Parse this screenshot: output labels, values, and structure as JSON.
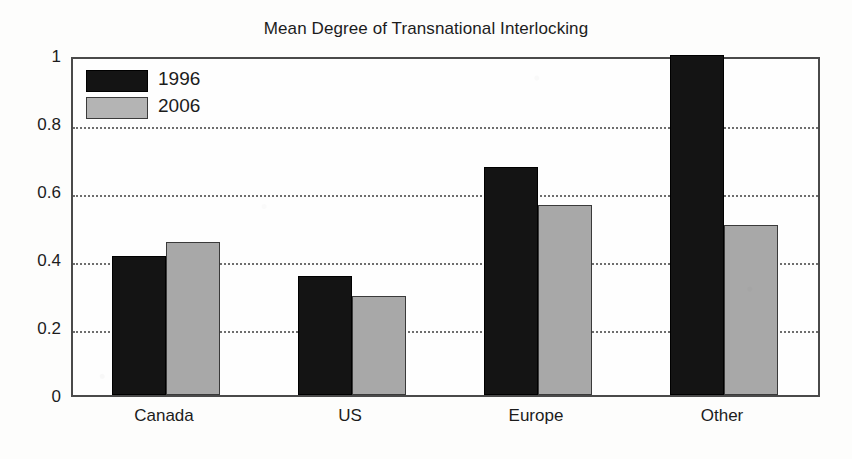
{
  "chart_data": {
    "type": "bar",
    "title": "Mean Degree of Transnational Interlocking",
    "xlabel": "",
    "ylabel": "",
    "categories": [
      "Canada",
      "US",
      "Europe",
      "Other"
    ],
    "series": [
      {
        "name": "1996",
        "color": "#141414",
        "values": [
          0.41,
          0.35,
          0.67,
          1.0
        ]
      },
      {
        "name": "2006",
        "color": "#a8a8a8",
        "values": [
          0.45,
          0.29,
          0.56,
          0.5
        ]
      }
    ],
    "ylim": [
      0,
      1
    ],
    "yticks": [
      "0",
      "0.2",
      "0.4",
      "0.6",
      "0.8",
      "1"
    ],
    "ytick_values": [
      0,
      0.2,
      0.4,
      0.6,
      0.8,
      1
    ],
    "grid": "horizontal-dotted",
    "legend_position": "top-left"
  },
  "legend": {
    "entries": [
      {
        "label": "1996"
      },
      {
        "label": "2006"
      }
    ]
  }
}
